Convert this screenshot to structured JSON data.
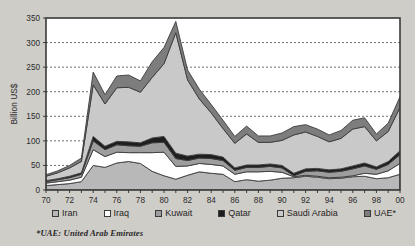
{
  "chart_data": {
    "type": "area",
    "stacked": true,
    "title": "",
    "xlabel": "",
    "ylabel": "Billion US$",
    "ylim": [
      0,
      350
    ],
    "ytick_step": 50,
    "yticks": [
      0,
      50,
      100,
      150,
      200,
      250,
      300,
      350
    ],
    "grid": "horizontal-dashed",
    "legend_position": "bottom",
    "x": [
      1970,
      1971,
      1972,
      1973,
      1974,
      1975,
      1976,
      1977,
      1978,
      1979,
      1980,
      1981,
      1982,
      1983,
      1984,
      1985,
      1986,
      1987,
      1988,
      1989,
      1990,
      1991,
      1992,
      1993,
      1994,
      1995,
      1996,
      1997,
      1998,
      1999,
      2000
    ],
    "xtick_labels": [
      "70",
      "",
      "72",
      "",
      "74",
      "",
      "76",
      "",
      "78",
      "",
      "80",
      "",
      "82",
      "",
      "84",
      "",
      "86",
      "",
      "88",
      "",
      "90",
      "",
      "92",
      "",
      "94",
      "",
      "96",
      "",
      "98",
      "",
      "00"
    ],
    "series": [
      {
        "name": "Iran",
        "color": "#b8b8b8",
        "values": [
          9,
          11,
          13,
          17,
          50,
          46,
          55,
          58,
          54,
          38,
          29,
          22,
          30,
          37,
          34,
          32,
          17,
          21,
          18,
          20,
          24,
          25,
          28,
          26,
          23,
          24,
          27,
          28,
          23,
          25,
          32
        ]
      },
      {
        "name": "Iraq",
        "color": "#ffffff",
        "values": [
          5,
          6,
          7,
          9,
          32,
          22,
          22,
          18,
          22,
          38,
          48,
          26,
          19,
          17,
          18,
          17,
          15,
          16,
          19,
          18,
          12,
          2,
          2,
          2,
          2,
          2,
          2,
          6,
          9,
          14,
          22
        ]
      },
      {
        "name": "Kuwait",
        "color": "#9d9d9d",
        "values": [
          3,
          4,
          5,
          6,
          18,
          14,
          15,
          14,
          13,
          20,
          20,
          16,
          11,
          11,
          12,
          11,
          8,
          9,
          9,
          10,
          9,
          2,
          8,
          11,
          11,
          12,
          14,
          15,
          10,
          13,
          18
        ]
      },
      {
        "name": "Qatar",
        "color": "#1e1e1e",
        "values": [
          2,
          2,
          3,
          3,
          9,
          7,
          7,
          8,
          7,
          10,
          12,
          11,
          9,
          8,
          8,
          7,
          5,
          5,
          5,
          5,
          5,
          5,
          5,
          5,
          5,
          5,
          6,
          6,
          5,
          6,
          8
        ]
      },
      {
        "name": "Saudi Arabia",
        "color": "#c9c9c9",
        "values": [
          9,
          12,
          17,
          23,
          105,
          86,
          109,
          111,
          103,
          123,
          148,
          245,
          155,
          112,
          85,
          58,
          50,
          63,
          46,
          44,
          51,
          78,
          75,
          65,
          57,
          62,
          75,
          74,
          53,
          61,
          88
        ]
      },
      {
        "name": "UAE*",
        "color": "#7d7d7d",
        "values": [
          3,
          4,
          5,
          7,
          26,
          19,
          24,
          25,
          23,
          32,
          33,
          23,
          20,
          20,
          17,
          17,
          14,
          16,
          13,
          13,
          15,
          17,
          15,
          15,
          14,
          16,
          18,
          18,
          14,
          17,
          22
        ]
      }
    ],
    "peak": {
      "year": 1981,
      "total": 343
    }
  },
  "legend": {
    "items": [
      {
        "label": "Iran"
      },
      {
        "label": "Iraq"
      },
      {
        "label": "Kuwait"
      },
      {
        "label": "Qatar"
      },
      {
        "label": "Saudi Arabia"
      },
      {
        "label": "UAE*"
      }
    ]
  },
  "footnote": {
    "text": "*UAE: United Arab Emirates"
  },
  "colors": {
    "background": "#cfcdc8",
    "plot_background": "#ffffff",
    "axis": "#3a3a3a",
    "grid": "#4a4a4a",
    "series_outline": "#3c3c3c"
  }
}
